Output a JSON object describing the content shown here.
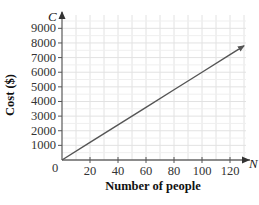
{
  "chart_data": {
    "type": "line",
    "title": "",
    "xlabel": "Number of people",
    "ylabel": "Cost ($)",
    "x_axis_variable": "N",
    "y_axis_variable": "C",
    "origin_label": "0",
    "xlim": [
      0,
      125
    ],
    "ylim": [
      0,
      9500
    ],
    "x_ticks": [
      20,
      40,
      60,
      80,
      100,
      120
    ],
    "x_tick_labels": [
      "20",
      "40",
      "60",
      "80",
      "100",
      "120"
    ],
    "y_ticks": [
      1000,
      2000,
      3000,
      4000,
      5000,
      6000,
      7000,
      8000,
      9000
    ],
    "y_tick_labels": [
      "1000",
      "2000",
      "3000",
      "4000",
      "5000",
      "6000",
      "7000",
      "8000",
      "9000"
    ],
    "grid": true,
    "legend": null,
    "series": [
      {
        "name": "C = 60N",
        "x": [
          0,
          20,
          40,
          60,
          80,
          100,
          120,
          130
        ],
        "y": [
          0,
          1200,
          2400,
          3600,
          4800,
          6000,
          7200,
          7800
        ],
        "arrow_end": true
      }
    ],
    "colors": {
      "line": "#555555",
      "grid": "#e2e2e2",
      "axis": "#666666"
    }
  }
}
